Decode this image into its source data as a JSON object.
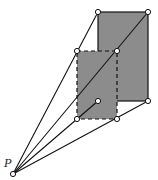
{
  "diagram": {
    "type": "perspective-projection",
    "point_label": "P",
    "colors": {
      "fill": "#8c8c8c",
      "stroke": "#111111",
      "background": "#ffffff"
    },
    "points": {
      "P": [
        13,
        174
      ],
      "back_tl": [
        98,
        12
      ],
      "back_tr": [
        148,
        12
      ],
      "back_bl": [
        98,
        101
      ],
      "back_br": [
        148,
        101
      ],
      "front_tl": [
        77,
        51
      ],
      "front_tr": [
        117,
        51
      ],
      "front_bl": [
        77,
        119
      ],
      "front_br": [
        117,
        119
      ]
    },
    "back_rectangle": {
      "style": "solid",
      "filled": true
    },
    "front_rectangle": {
      "style": "dashed",
      "filled": true
    },
    "rays_from_P": [
      "back_tl",
      "back_tr",
      "back_bl",
      "back_br"
    ]
  }
}
